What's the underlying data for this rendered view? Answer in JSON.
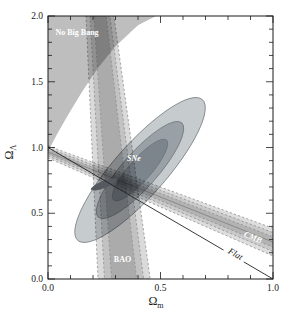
{
  "figure": {
    "width": 295,
    "height": 321,
    "background": "#ffffff",
    "ink": "#1a1a1a"
  },
  "chart_data": {
    "type": "contour-constraint-plot",
    "xlabel": {
      "base": "Ω",
      "sub": "m"
    },
    "ylabel": {
      "base": "Ω",
      "sub": "Λ"
    },
    "xlim": [
      0,
      1.0
    ],
    "ylim": [
      0,
      2.0
    ],
    "grid": false,
    "plot_rect_px": {
      "left": 48,
      "top": 16,
      "width": 225,
      "height": 263
    },
    "x_ticks": {
      "major": [
        0,
        0.5,
        1.0
      ],
      "labels": [
        "0.0",
        "0.5",
        "1.0"
      ],
      "minor_step": 0.1
    },
    "y_ticks": {
      "major": [
        0,
        0.5,
        1.0,
        1.5,
        2.0
      ],
      "labels": [
        "0.0",
        "0.5",
        "1.0",
        "1.5",
        "2.0"
      ],
      "minor_step": 0.1
    },
    "regions": {
      "no_big_bang": {
        "fill": "#bebebe",
        "boundary": [
          [
            0,
            0.97
          ],
          [
            0.04,
            1.1
          ],
          [
            0.09,
            1.25
          ],
          [
            0.15,
            1.42
          ],
          [
            0.22,
            1.6
          ],
          [
            0.3,
            1.77
          ],
          [
            0.4,
            1.93
          ],
          [
            0.48,
            2.0
          ]
        ]
      },
      "sne": {
        "center": [
          0.409,
          0.829
        ],
        "rotation_deg": -48.5,
        "stroke": "#6a7076",
        "levels": [
          {
            "rx_px": 94,
            "ry_px": 26,
            "fill": "#c6cbce"
          },
          {
            "rx_px": 63,
            "ry_px": 17.5,
            "fill": "#99a0a6"
          },
          {
            "rx_px": 40,
            "ry_px": 11,
            "fill": "#7c848c"
          }
        ]
      },
      "bao": {
        "top_center_x": 0.231,
        "bottom_center_x": 0.338,
        "stroke": "#8f8f8f",
        "levels": [
          {
            "half_top": 0.062,
            "half_bottom": 0.116,
            "fill": "#d6d6d6"
          },
          {
            "half_top": 0.044,
            "half_bottom": 0.087,
            "fill": "#c0c0c0"
          },
          {
            "half_top": 0.027,
            "half_bottom": 0.056,
            "fill": "#a8a8a8"
          }
        ]
      },
      "cmb": {
        "left_end": [
          0,
          0.966
        ],
        "right_end": [
          1.0,
          0.281
        ],
        "stroke": "#8f8f8f",
        "center_line_color": "#777777",
        "levels": [
          {
            "half_left": 0.046,
            "half_right": 0.105,
            "fill": "#dadada"
          },
          {
            "half_left": 0.03,
            "half_right": 0.072,
            "fill": "#c6c6c6"
          },
          {
            "half_left": 0.015,
            "half_right": 0.04,
            "fill": "#b0b0b0"
          }
        ]
      },
      "combined_fit": {
        "center": [
          0.249,
          0.719
        ],
        "rotation_deg": -21.5,
        "rx_px": 14,
        "ry_px": 3.6,
        "fill": "#555a60"
      }
    },
    "flat_line": {
      "color": "#222222",
      "segments": [
        [
          [
            0,
            1.0
          ],
          [
            0.78,
            0.22
          ]
        ],
        [
          [
            0.87,
            0.13
          ],
          [
            1.0,
            0
          ]
        ]
      ]
    },
    "labels": [
      {
        "id": "no-big-bang",
        "text": "No Big Bang",
        "x": 0.129,
        "y": 1.856,
        "color": "#ffffff",
        "size": 8,
        "bold": true,
        "italic": false,
        "rotate": 0
      },
      {
        "id": "sne",
        "text": "SNe",
        "x": 0.382,
        "y": 0.897,
        "color": "#ffffff",
        "size": 8,
        "bold": true,
        "italic": true,
        "rotate": 0
      },
      {
        "id": "bao",
        "text": "BAO",
        "x": 0.331,
        "y": 0.133,
        "color": "#ffffff",
        "size": 8,
        "bold": true,
        "italic": false,
        "rotate": 0
      },
      {
        "id": "cmb",
        "text": "CMB",
        "x": 0.907,
        "y": 0.297,
        "color": "#ffffff",
        "size": 8.5,
        "bold": true,
        "italic": true,
        "rotate": 21
      },
      {
        "id": "flat",
        "text": "Flat",
        "x": 0.827,
        "y": 0.171,
        "color": "#1a1a1a",
        "size": 9,
        "bold": false,
        "italic": true,
        "rotate": 30
      }
    ]
  }
}
